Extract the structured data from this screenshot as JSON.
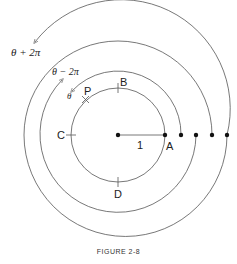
{
  "figure": {
    "caption": "FIGURE 2-8",
    "labels": {
      "theta_plus": "θ + 2π",
      "theta_minus": "θ − 2π",
      "theta": "θ",
      "P": "P",
      "B": "B",
      "C": "C",
      "A": "A",
      "D": "D",
      "radius": "1"
    },
    "colors": {
      "stroke": "#555555",
      "text": "#222222",
      "background": "#ffffff"
    }
  }
}
